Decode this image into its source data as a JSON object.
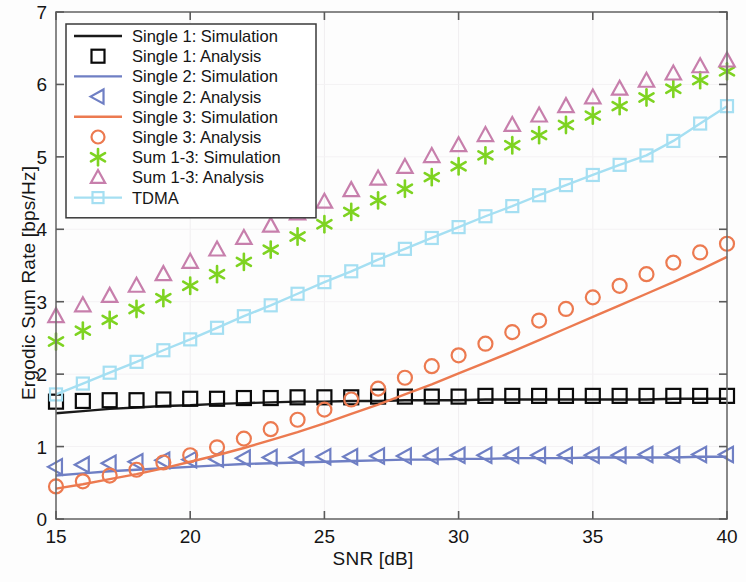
{
  "chart_data": {
    "type": "line",
    "title": "",
    "xlabel": "SNR [dB]",
    "ylabel": "Ergodic Sum Rate [bps/Hz]",
    "xlim": [
      15,
      40
    ],
    "ylim": [
      0,
      7
    ],
    "xticks": [
      15,
      20,
      25,
      30,
      35,
      40
    ],
    "yticks": [
      0,
      1,
      2,
      3,
      4,
      5,
      6,
      7
    ],
    "grid": false,
    "legend_position": "upper-left",
    "x": [
      15,
      16,
      17,
      18,
      19,
      20,
      21,
      22,
      23,
      24,
      25,
      26,
      27,
      28,
      29,
      30,
      31,
      32,
      33,
      34,
      35,
      36,
      37,
      38,
      39,
      40
    ],
    "series": [
      {
        "name": "Single 1: Simulation",
        "style": "line",
        "color": "#1a1a1a",
        "values": [
          1.46,
          1.49,
          1.52,
          1.54,
          1.56,
          1.57,
          1.59,
          1.6,
          1.61,
          1.62,
          1.62,
          1.63,
          1.63,
          1.64,
          1.64,
          1.64,
          1.65,
          1.65,
          1.65,
          1.65,
          1.65,
          1.65,
          1.65,
          1.66,
          1.66,
          1.66
        ]
      },
      {
        "name": "Single 1: Analysis",
        "style": "marker",
        "marker": "square",
        "color": "#0a0a0a",
        "values": [
          1.62,
          1.63,
          1.64,
          1.64,
          1.65,
          1.66,
          1.66,
          1.67,
          1.67,
          1.68,
          1.68,
          1.68,
          1.69,
          1.69,
          1.69,
          1.69,
          1.7,
          1.7,
          1.7,
          1.7,
          1.7,
          1.7,
          1.7,
          1.7,
          1.7,
          1.7
        ]
      },
      {
        "name": "Single 2: Simulation",
        "style": "line",
        "color": "#6f7fc4",
        "values": [
          0.6,
          0.63,
          0.66,
          0.68,
          0.7,
          0.72,
          0.74,
          0.76,
          0.77,
          0.78,
          0.79,
          0.8,
          0.81,
          0.82,
          0.82,
          0.83,
          0.83,
          0.84,
          0.84,
          0.84,
          0.85,
          0.85,
          0.85,
          0.85,
          0.86,
          0.86
        ]
      },
      {
        "name": "Single 2: Analysis",
        "style": "marker",
        "marker": "left-triangle",
        "color": "#6f7fc4",
        "values": [
          0.72,
          0.75,
          0.77,
          0.79,
          0.81,
          0.82,
          0.83,
          0.84,
          0.85,
          0.85,
          0.86,
          0.86,
          0.87,
          0.87,
          0.87,
          0.88,
          0.88,
          0.88,
          0.88,
          0.88,
          0.88,
          0.88,
          0.89,
          0.89,
          0.89,
          0.89
        ]
      },
      {
        "name": "Single 3: Simulation",
        "style": "line",
        "color": "#ec7a50",
        "values": [
          0.42,
          0.48,
          0.55,
          0.62,
          0.7,
          0.79,
          0.88,
          0.98,
          1.09,
          1.2,
          1.32,
          1.45,
          1.58,
          1.72,
          1.86,
          2.01,
          2.16,
          2.31,
          2.47,
          2.63,
          2.79,
          2.95,
          3.11,
          3.27,
          3.44,
          3.62
        ]
      },
      {
        "name": "Single 3: Analysis",
        "style": "marker",
        "marker": "circle",
        "color": "#ec7a50",
        "values": [
          0.45,
          0.52,
          0.6,
          0.68,
          0.78,
          0.88,
          0.99,
          1.11,
          1.24,
          1.37,
          1.51,
          1.65,
          1.8,
          1.95,
          2.11,
          2.26,
          2.42,
          2.58,
          2.74,
          2.9,
          3.06,
          3.22,
          3.38,
          3.54,
          3.68,
          3.8
        ]
      },
      {
        "name": "Sum 1-3: Simulation",
        "style": "marker",
        "marker": "asterisk",
        "color": "#7ed321",
        "values": [
          2.45,
          2.6,
          2.75,
          2.9,
          3.05,
          3.22,
          3.38,
          3.55,
          3.72,
          3.9,
          4.07,
          4.24,
          4.4,
          4.56,
          4.72,
          4.87,
          5.02,
          5.16,
          5.3,
          5.44,
          5.57,
          5.7,
          5.82,
          5.94,
          6.06,
          6.18
        ]
      },
      {
        "name": "Sum 1-3: Analysis",
        "style": "marker",
        "marker": "triangle",
        "color": "#c77fac",
        "values": [
          2.8,
          2.95,
          3.08,
          3.22,
          3.38,
          3.55,
          3.72,
          3.88,
          4.05,
          4.22,
          4.38,
          4.54,
          4.7,
          4.86,
          5.01,
          5.16,
          5.3,
          5.44,
          5.57,
          5.7,
          5.82,
          5.94,
          6.05,
          6.15,
          6.25,
          6.33
        ]
      },
      {
        "name": "TDMA",
        "style": "line-marker",
        "marker": "square",
        "color": "#a5dff2",
        "values": [
          1.72,
          1.87,
          2.02,
          2.17,
          2.33,
          2.48,
          2.64,
          2.8,
          2.95,
          3.11,
          3.27,
          3.42,
          3.58,
          3.73,
          3.88,
          4.03,
          4.18,
          4.32,
          4.47,
          4.61,
          4.75,
          4.89,
          5.02,
          5.22,
          5.46,
          5.7
        ]
      }
    ],
    "legend": [
      {
        "label": "Single 1: Simulation",
        "style": "line",
        "color": "#1a1a1a"
      },
      {
        "label": "Single 1: Analysis",
        "style": "marker",
        "marker": "square",
        "color": "#0a0a0a"
      },
      {
        "label": "Single 2: Simulation",
        "style": "line",
        "color": "#6f7fc4"
      },
      {
        "label": "Single 2: Analysis",
        "style": "marker",
        "marker": "left-triangle",
        "color": "#6f7fc4"
      },
      {
        "label": "Single 3: Simulation",
        "style": "line",
        "color": "#ec7a50"
      },
      {
        "label": "Single 3: Analysis",
        "style": "marker",
        "marker": "circle",
        "color": "#ec7a50"
      },
      {
        "label": "Sum 1-3: Simulation",
        "style": "marker",
        "marker": "asterisk",
        "color": "#7ed321"
      },
      {
        "label": "Sum 1-3: Analysis",
        "style": "marker",
        "marker": "triangle",
        "color": "#c77fac"
      },
      {
        "label": "TDMA",
        "style": "line-marker",
        "marker": "square",
        "color": "#a5dff2"
      }
    ]
  },
  "axes": {
    "xlabel": "SNR [dB]",
    "ylabel": "Ergodic Sum Rate [bps/Hz]"
  }
}
